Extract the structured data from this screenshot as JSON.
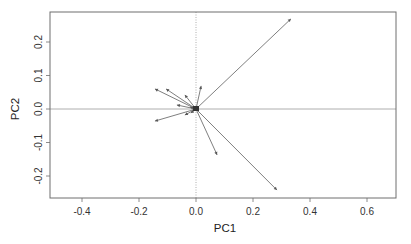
{
  "chart_data": {
    "type": "scatter",
    "subtype": "pca-loadings-biplot",
    "title": "",
    "xlabel": "PC1",
    "ylabel": "PC2",
    "xlim": [
      -0.51,
      0.7
    ],
    "ylim": [
      -0.265,
      0.29
    ],
    "xticks": [
      -0.4,
      -0.2,
      0.0,
      0.2,
      0.4,
      0.6
    ],
    "xtick_labels": [
      "-0.4",
      "-0.2",
      "0.0",
      "0.2",
      "0.4",
      "0.6"
    ],
    "yticks": [
      -0.2,
      -0.1,
      0.0,
      0.1,
      0.2
    ],
    "ytick_labels": [
      "-0.2",
      "-0.1",
      "0.0",
      "0.1",
      "0.2"
    ],
    "grid": false,
    "reference_lines": {
      "horizontal_at_zero": "solid",
      "vertical_at_zero": "dotted"
    },
    "legend": null,
    "arrows_from_origin": [
      {
        "pc1": 0.333,
        "pc2": 0.269
      },
      {
        "pc1": 0.284,
        "pc2": -0.242
      },
      {
        "pc1": 0.074,
        "pc2": -0.137
      },
      {
        "pc1": 0.018,
        "pc2": 0.069
      },
      {
        "pc1": -0.144,
        "pc2": 0.06
      },
      {
        "pc1": -0.105,
        "pc2": 0.06
      },
      {
        "pc1": -0.039,
        "pc2": 0.042
      },
      {
        "pc1": -0.067,
        "pc2": 0.012
      },
      {
        "pc1": -0.144,
        "pc2": -0.036
      },
      {
        "pc1": -0.039,
        "pc2": -0.018
      },
      {
        "pc1": -0.018,
        "pc2": -0.012
      },
      {
        "pc1": -0.021,
        "pc2": 0.006
      },
      {
        "pc1": -0.01,
        "pc2": 0.003
      },
      {
        "pc1": 0.006,
        "pc2": 0.004
      },
      {
        "pc1": -0.006,
        "pc2": -0.005
      }
    ],
    "colors": {
      "arrow": "#707070",
      "frame": "#6e6e6e",
      "refline": "#9a9a9a"
    }
  },
  "labels": {
    "xlabel": "PC1",
    "ylabel": "PC2",
    "xticks": [
      "-0.4",
      "-0.2",
      "0.0",
      "0.2",
      "0.4",
      "0.6"
    ],
    "yticks": [
      "-0.2",
      "-0.1",
      "0.0",
      "0.1",
      "0.2"
    ]
  }
}
